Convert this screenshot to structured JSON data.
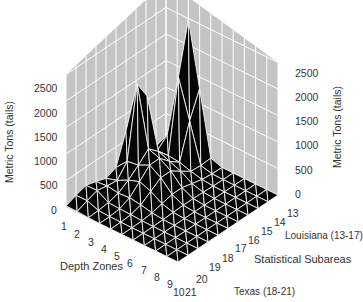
{
  "chart_data": {
    "type": "surface",
    "title": "",
    "zlabel": "Metric Tons (tails)",
    "xlabel": "Depth Zones",
    "ylabel": "Statistical Subareas",
    "z_ticks": [
      "0",
      "500",
      "1000",
      "1500",
      "2000",
      "2500"
    ],
    "zlim": [
      0,
      2500
    ],
    "depth_zones": [
      "1",
      "2",
      "3",
      "4",
      "5",
      "6",
      "7",
      "8",
      "9",
      "10"
    ],
    "subareas": [
      "13",
      "14",
      "15",
      "16",
      "17",
      "18",
      "19",
      "20",
      "21"
    ],
    "subarea_groups": [
      {
        "label": "Louisiana (13-17)",
        "range": [
          13,
          17
        ]
      },
      {
        "label": "Texas (18-21)",
        "range": [
          18,
          21
        ]
      }
    ],
    "peaks": [
      {
        "depth_zone": 3,
        "subarea": 21,
        "value_approx": 1900
      },
      {
        "depth_zone": 1,
        "subarea": 13,
        "value_approx": 2800
      }
    ],
    "grid": true
  },
  "axes": {
    "left_z_label": "Metric Tons (tails)",
    "right_z_label": "Metric Tons (tails)",
    "depth_label": "Depth Zones",
    "subarea_label": "Statistical Subareas",
    "louisiana_label": "Louisiana (13-17)",
    "texas_label": "Texas (18-21)"
  }
}
